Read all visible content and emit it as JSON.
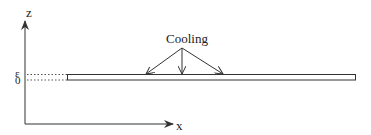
{
  "diagram": {
    "axes": {
      "z_label": "z",
      "x_label": "x"
    },
    "plate": {
      "top_label": "ε",
      "bottom_label": "0"
    },
    "annotation": {
      "label": "Cooling",
      "arrow_count": 3
    },
    "colors": {
      "line": "#333333",
      "background": "#ffffff"
    }
  }
}
